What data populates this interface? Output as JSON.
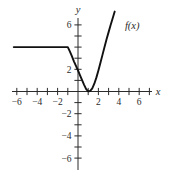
{
  "figure": {
    "background": "#ffffff",
    "curve_color": "#111111",
    "axis_color": "#2b2b2b"
  },
  "chart_data": {
    "type": "line",
    "title": "",
    "subtitle": "",
    "xlabel": "x",
    "ylabel": "y",
    "xlim": [
      -7.0,
      7.6
    ],
    "ylim": [
      -7.2,
      7.6
    ],
    "grid": false,
    "legend": "none",
    "annotations": [
      {
        "text": "f(x)",
        "x": 4.6,
        "y": 5.6
      }
    ],
    "x_ticks": [
      -6,
      -5,
      -4,
      -3,
      -2,
      -1,
      1,
      2,
      3,
      4,
      5,
      6,
      7
    ],
    "x_tick_labels": [
      "-6",
      "",
      "-4",
      "",
      "-2",
      "",
      "",
      "2",
      "",
      "4",
      "",
      "6",
      ""
    ],
    "x_labeled_ticks": [
      {
        "value": -6,
        "label": "-6"
      },
      {
        "value": -4,
        "label": "-4"
      },
      {
        "value": -2,
        "label": "-2"
      },
      {
        "value": 2,
        "label": "2"
      },
      {
        "value": 4,
        "label": "4"
      },
      {
        "value": 6,
        "label": "6"
      }
    ],
    "y_ticks": [
      -6,
      -5,
      -4,
      -3,
      -2,
      -1,
      1,
      2,
      3,
      4,
      5,
      6
    ],
    "y_labeled_ticks": [
      {
        "value": 6,
        "label": "6"
      },
      {
        "value": 2,
        "label": "2"
      },
      {
        "value": -2,
        "label": "-2"
      },
      {
        "value": -4,
        "label": "-4"
      },
      {
        "value": -6,
        "label": "-6"
      }
    ],
    "series": [
      {
        "name": "f(x)",
        "description": "Piecewise: constant y=4 for x<=-1, then a steeply falling branch reaching a minimum at (1, 0) and rising again",
        "points": [
          [
            -6.3,
            4.0
          ],
          [
            -5.0,
            4.0
          ],
          [
            -4.0,
            4.0
          ],
          [
            -3.0,
            4.0
          ],
          [
            -2.0,
            4.0
          ],
          [
            -1.2,
            4.0
          ],
          [
            -1.0,
            4.0
          ],
          [
            -0.8,
            3.62
          ],
          [
            -0.6,
            3.18
          ],
          [
            -0.4,
            2.72
          ],
          [
            -0.2,
            2.3
          ],
          [
            0.0,
            1.9
          ],
          [
            0.2,
            1.45
          ],
          [
            0.4,
            1.02
          ],
          [
            0.6,
            0.6
          ],
          [
            0.8,
            0.22
          ],
          [
            1.0,
            0.02
          ],
          [
            1.2,
            0.05
          ],
          [
            1.4,
            0.28
          ],
          [
            1.6,
            0.7
          ],
          [
            1.8,
            1.25
          ],
          [
            2.0,
            1.9
          ],
          [
            2.2,
            2.6
          ],
          [
            2.4,
            3.3
          ],
          [
            2.6,
            4.0
          ],
          [
            2.8,
            4.7
          ],
          [
            3.0,
            5.35
          ],
          [
            3.2,
            6.0
          ],
          [
            3.4,
            6.6
          ],
          [
            3.6,
            7.2
          ]
        ]
      }
    ],
    "key_features": {
      "minimum": {
        "x": 1,
        "y": 0
      },
      "constant_value": 4,
      "constant_domain_end": -1
    }
  },
  "axes": {
    "x_axis_label": "x",
    "y_axis_label": "y"
  }
}
